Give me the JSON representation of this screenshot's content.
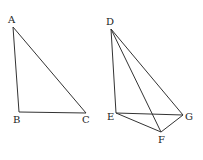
{
  "figures": [
    {
      "name": "triangle-abc",
      "points": {
        "A": {
          "label": "A"
        },
        "B": {
          "label": "B"
        },
        "C": {
          "label": "C"
        }
      }
    },
    {
      "name": "pyramid-defg",
      "points": {
        "D": {
          "label": "D"
        },
        "E": {
          "label": "E"
        },
        "F": {
          "label": "F"
        },
        "G": {
          "label": "G"
        }
      }
    }
  ]
}
